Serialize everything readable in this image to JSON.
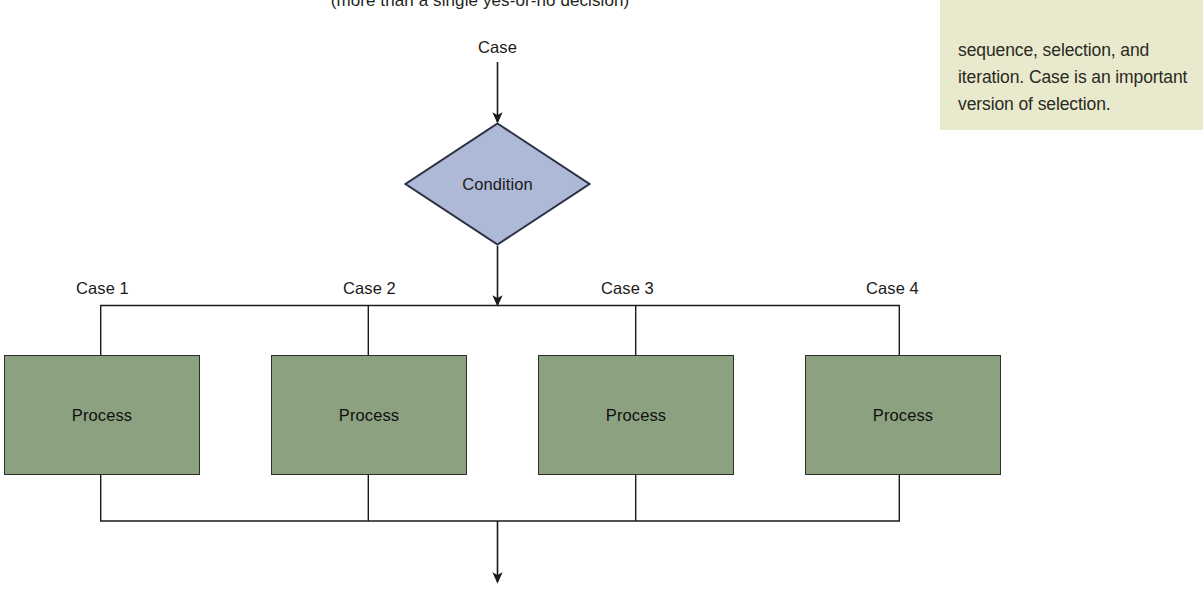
{
  "diagram": {
    "caption": "(more than a single yes-or-no decision)",
    "entry_label": "Case",
    "decision": {
      "label": "Condition",
      "fill": "#adb9d6",
      "stroke": "#2c3144"
    },
    "branch_labels": [
      "Case 1",
      "Case 2",
      "Case 3",
      "Case 4"
    ],
    "process_boxes": [
      {
        "label": "Process"
      },
      {
        "label": "Process"
      },
      {
        "label": "Process"
      },
      {
        "label": "Process"
      }
    ],
    "process_fill": "#8ba180",
    "process_stroke": "#2e2e2e",
    "connector_color": "#1a1a1a"
  },
  "margin_note": {
    "text": "sequence, selection, and iteration. Case is an important version of selection.",
    "background": "#e9e9cd"
  }
}
